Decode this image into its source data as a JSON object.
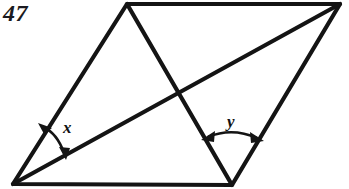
{
  "figure": {
    "problem_number": "47",
    "background_color": "#ffffff",
    "stroke_color": "#141414",
    "labels": {
      "angle_x": "x",
      "angle_y": "y"
    },
    "geometry": {
      "shape": "parallelogram",
      "vertices": {
        "bottom_left": [
          13,
          184
        ],
        "top_left": [
          127,
          4
        ],
        "top_right": [
          340,
          4
        ],
        "bottom_right": [
          232,
          185
        ]
      },
      "diagonals": [
        {
          "name": "diagonal-top-left-to-bottom-right",
          "from": [
            127,
            4
          ],
          "to": [
            232,
            185
          ]
        },
        {
          "name": "diagonal-bottom-left-to-top-right",
          "from": [
            13,
            184
          ],
          "to": [
            340,
            4
          ]
        }
      ],
      "intersection": [
        177,
        96
      ],
      "angle_marks": [
        {
          "name": "angle-x",
          "vertex": [
            13,
            184
          ],
          "label": "x"
        },
        {
          "name": "angle-y",
          "vertex": [
            232,
            185
          ],
          "label": "y"
        }
      ]
    }
  }
}
